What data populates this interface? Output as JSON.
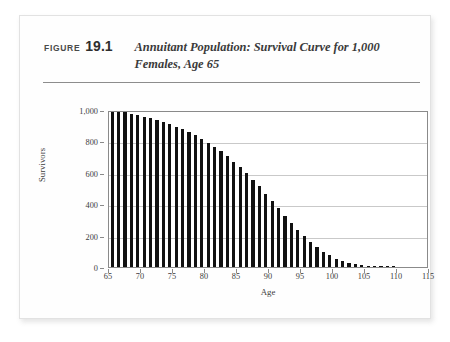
{
  "figure": {
    "label": "FIGURE",
    "number": "19.1",
    "title": "Annuitant Population: Survival Curve for 1,000 Females, Age 65"
  },
  "chart_data": {
    "type": "bar",
    "title": "Annuitant Population: Survival Curve for 1,000 Females, Age 65",
    "xlabel": "Age",
    "ylabel": "Survivors",
    "xlim": [
      65,
      115
    ],
    "ylim": [
      0,
      1000
    ],
    "grid": true,
    "legend": null,
    "bar_color": "#111111",
    "x_ticks": [
      "65",
      "70",
      "75",
      "80",
      "85",
      "90",
      "95",
      "100",
      "105",
      "110",
      "115"
    ],
    "x_tick_values": [
      65,
      70,
      75,
      80,
      85,
      90,
      95,
      100,
      105,
      110,
      115
    ],
    "y_ticks": [
      "0",
      "200",
      "400",
      "600",
      "800",
      "1,000"
    ],
    "y_tick_values": [
      0,
      200,
      400,
      600,
      800,
      1000
    ],
    "categories": [
      65,
      66,
      67,
      68,
      69,
      70,
      71,
      72,
      73,
      74,
      75,
      76,
      77,
      78,
      79,
      80,
      81,
      82,
      83,
      84,
      85,
      86,
      87,
      88,
      89,
      90,
      91,
      92,
      93,
      94,
      95,
      96,
      97,
      98,
      99,
      100,
      101,
      102,
      103,
      104,
      105,
      106,
      107,
      108,
      109,
      110
    ],
    "values": [
      1000,
      993,
      985,
      977,
      968,
      958,
      947,
      935,
      922,
      908,
      893,
      876,
      858,
      838,
      816,
      792,
      766,
      737,
      706,
      672,
      636,
      597,
      556,
      513,
      468,
      422,
      375,
      328,
      282,
      238,
      197,
      160,
      127,
      98,
      74,
      54,
      38,
      26,
      17,
      11,
      7,
      4,
      2,
      1,
      1,
      0
    ]
  }
}
